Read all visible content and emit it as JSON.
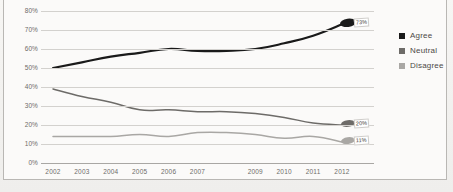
{
  "figure": {
    "title": "",
    "background_color": "#f4f3f1",
    "frame_color": "#b9b7b4"
  },
  "legend": {
    "position": "right",
    "entries": [
      {
        "label": "Agree",
        "color": "#1a1a1a"
      },
      {
        "label": "Neutral",
        "color": "#6d6b68"
      },
      {
        "label": "Disagree",
        "color": "#a9a7a4"
      }
    ]
  },
  "axes": {
    "y_ticks": [
      "80%",
      "70%",
      "60%",
      "50%",
      "40%",
      "30%",
      "20%",
      "10%",
      "0%"
    ],
    "x_ticks": [
      "2002",
      "2003",
      "2004",
      "2005",
      "2006",
      "2007",
      "2009",
      "2010",
      "2011",
      "2012"
    ]
  },
  "endpoint_labels": {
    "agree": "73%",
    "neutral": "20%",
    "disagree": "11%"
  },
  "chart_data": {
    "type": "line",
    "title": "",
    "xlabel": "",
    "ylabel": "",
    "ylim": [
      0,
      80
    ],
    "grid": true,
    "legend_position": "right",
    "x": [
      2002,
      2003,
      2004,
      2005,
      2006,
      2007,
      2008,
      2009,
      2010,
      2011,
      2012
    ],
    "tick_labels": [
      "2002",
      "2003",
      "2004",
      "2005",
      "2006",
      "2007",
      "2009",
      "2010",
      "2011",
      "2012"
    ],
    "series": [
      {
        "name": "Agree",
        "color": "#1a1a1a",
        "values": [
          50,
          53,
          56,
          58,
          60,
          59,
          59,
          60,
          63,
          67,
          73
        ]
      },
      {
        "name": "Neutral",
        "color": "#6d6b68",
        "values": [
          39,
          35,
          32,
          28,
          28,
          27,
          27,
          26,
          24,
          21,
          20
        ]
      },
      {
        "name": "Disagree",
        "color": "#a9a7a4",
        "values": [
          14,
          14,
          14,
          15,
          14,
          16,
          16,
          15,
          13,
          14,
          11
        ]
      }
    ]
  }
}
